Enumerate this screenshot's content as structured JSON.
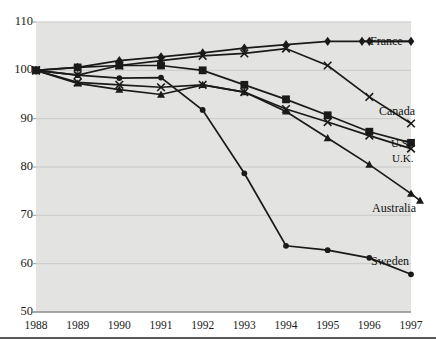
{
  "chart_data": {
    "type": "line",
    "title": "",
    "xlabel": "",
    "ylabel": "",
    "x": [
      1988,
      1989,
      1990,
      1991,
      1992,
      1993,
      1994,
      1995,
      1996,
      1997
    ],
    "xticklabels": [
      "1988",
      "1989",
      "1990",
      "1991",
      "1992",
      "1993",
      "1994",
      "1995",
      "1996",
      "1997"
    ],
    "yticks": [
      50,
      60,
      70,
      80,
      90,
      100,
      110
    ],
    "yticklabels": [
      "50",
      "60",
      "70",
      "80",
      "90",
      "100",
      "110"
    ],
    "ylim": [
      50,
      110
    ],
    "xlim": [
      1988,
      1997
    ],
    "grid": true,
    "legend_position": "right-inline",
    "plot_background": "#e3e3e1",
    "line_color": "#1a1a1a",
    "grid_color": "#c9c9c7",
    "series": [
      {
        "name": "France",
        "label": "France",
        "marker": "diamond",
        "values": [
          100.0,
          100.6,
          102.0,
          102.8,
          103.6,
          104.6,
          105.3,
          106.0,
          106.0,
          106.0
        ]
      },
      {
        "name": "Canada",
        "label": "Canada",
        "marker": "x",
        "values": [
          100.0,
          99.0,
          101.0,
          102.0,
          103.0,
          103.5,
          104.5,
          101.0,
          94.5,
          89.0
        ]
      },
      {
        "name": "U.S.",
        "label": "U.S.",
        "marker": "square",
        "values": [
          100.0,
          100.6,
          101.0,
          101.0,
          100.0,
          97.0,
          94.0,
          90.7,
          87.3,
          85.0
        ]
      },
      {
        "name": "U.K.",
        "label": "U.K.",
        "marker": "x",
        "values": [
          100.0,
          97.5,
          97.0,
          96.5,
          97.0,
          95.5,
          92.0,
          89.3,
          86.5,
          83.8
        ]
      },
      {
        "name": "Australia",
        "label": "Australia",
        "marker": "triangle",
        "values": [
          100.0,
          97.3,
          96.0,
          95.0,
          97.0,
          95.5,
          91.5,
          86.0,
          80.5,
          74.5
        ]
      },
      {
        "name": "Sweden",
        "label": "Sweden",
        "marker": "circle",
        "values": [
          100.0,
          99.0,
          98.4,
          98.5,
          91.8,
          78.7,
          63.7,
          62.8,
          61.2,
          57.8
        ]
      }
    ],
    "series_label_positions": [
      {
        "series": "France",
        "x": 370,
        "y": 34
      },
      {
        "series": "Canada",
        "x": 379,
        "y": 104
      },
      {
        "series": "U.S.",
        "x": 391,
        "y": 137
      },
      {
        "series": "U.K.",
        "x": 392,
        "y": 152
      },
      {
        "series": "Australia",
        "x": 372,
        "y": 201
      },
      {
        "series": "Sweden",
        "x": 371,
        "y": 254
      }
    ]
  }
}
